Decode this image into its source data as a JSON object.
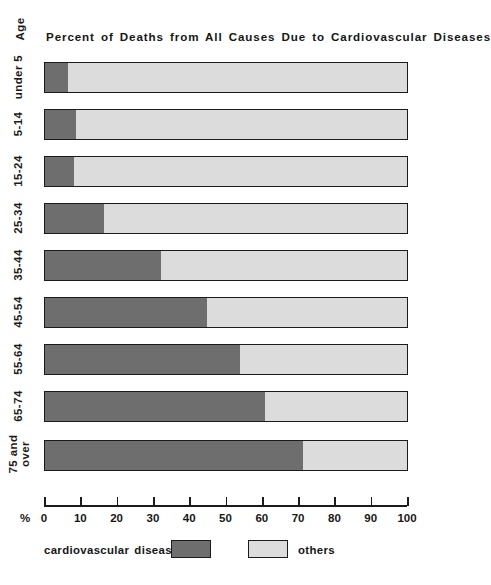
{
  "chart_data": {
    "type": "bar",
    "orientation": "horizontal",
    "stacked": true,
    "title": "Percent of Deaths from All Causes Due to Cardiovascular Diseases",
    "xlabel": "%",
    "ylabel": "Age",
    "xlim": [
      0,
      100
    ],
    "grid": false,
    "legend_position": "bottom",
    "categories": [
      "under 5",
      "5-14",
      "15-24",
      "25-34",
      "35-44",
      "45-54",
      "55-64",
      "65-74",
      "75 and over"
    ],
    "series": [
      {
        "name": "cardiovascular diseases",
        "color": "#6e6e6e",
        "values": [
          6.6,
          8.8,
          8.3,
          16.6,
          32.3,
          45.0,
          53.9,
          61.0,
          71.3
        ]
      },
      {
        "name": "others",
        "color": "#dcdcdc",
        "values": [
          93.4,
          91.2,
          91.7,
          83.4,
          67.7,
          55.0,
          46.1,
          39.0,
          28.7
        ]
      }
    ],
    "xticks": [
      0,
      10,
      20,
      30,
      40,
      50,
      60,
      70,
      80,
      90,
      100
    ],
    "xtick_labels": [
      "0",
      "10",
      "20",
      "30",
      "40",
      "50",
      "60",
      "70",
      "80",
      "90",
      "100"
    ]
  },
  "axis": {
    "y_title": "Age",
    "x_unit_symbol": "%"
  },
  "legend": {
    "items": [
      {
        "label": "cardiovascular diseases",
        "color": "#6e6e6e"
      },
      {
        "label": "others",
        "color": "#dcdcdc"
      }
    ]
  }
}
